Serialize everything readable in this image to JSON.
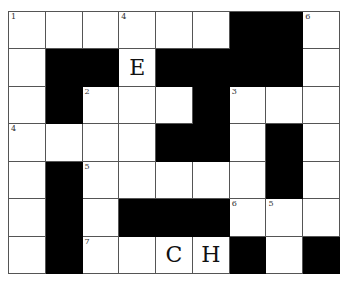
{
  "puzzle": {
    "rows": 7,
    "cols": 9,
    "grid": [
      [
        "W",
        "W",
        "W",
        "W",
        "W",
        "W",
        "B",
        "B",
        "W"
      ],
      [
        "W",
        "B",
        "B",
        "W",
        "B",
        "B",
        "B",
        "B",
        "W"
      ],
      [
        "W",
        "B",
        "W",
        "W",
        "W",
        "B",
        "W",
        "W",
        "W"
      ],
      [
        "W",
        "W",
        "W",
        "W",
        "B",
        "B",
        "W",
        "B",
        "W"
      ],
      [
        "W",
        "B",
        "W",
        "W",
        "W",
        "W",
        "W",
        "B",
        "W"
      ],
      [
        "W",
        "B",
        "W",
        "B",
        "B",
        "B",
        "W",
        "W",
        "W"
      ],
      [
        "W",
        "B",
        "W",
        "W",
        "W",
        "W",
        "B",
        "W",
        "B"
      ]
    ],
    "numbers": [
      {
        "row": 0,
        "col": 0,
        "label": "1"
      },
      {
        "row": 0,
        "col": 3,
        "label": "4"
      },
      {
        "row": 0,
        "col": 8,
        "label": "6"
      },
      {
        "row": 2,
        "col": 2,
        "label": "2"
      },
      {
        "row": 2,
        "col": 6,
        "label": "3"
      },
      {
        "row": 3,
        "col": 0,
        "label": "4"
      },
      {
        "row": 4,
        "col": 2,
        "label": "5"
      },
      {
        "row": 5,
        "col": 6,
        "label": "6"
      },
      {
        "row": 5,
        "col": 7,
        "label": "5"
      },
      {
        "row": 6,
        "col": 2,
        "label": "7"
      }
    ],
    "letters": [
      {
        "row": 1,
        "col": 3,
        "value": "E"
      },
      {
        "row": 6,
        "col": 4,
        "value": "C"
      },
      {
        "row": 6,
        "col": 5,
        "value": "H"
      }
    ]
  }
}
